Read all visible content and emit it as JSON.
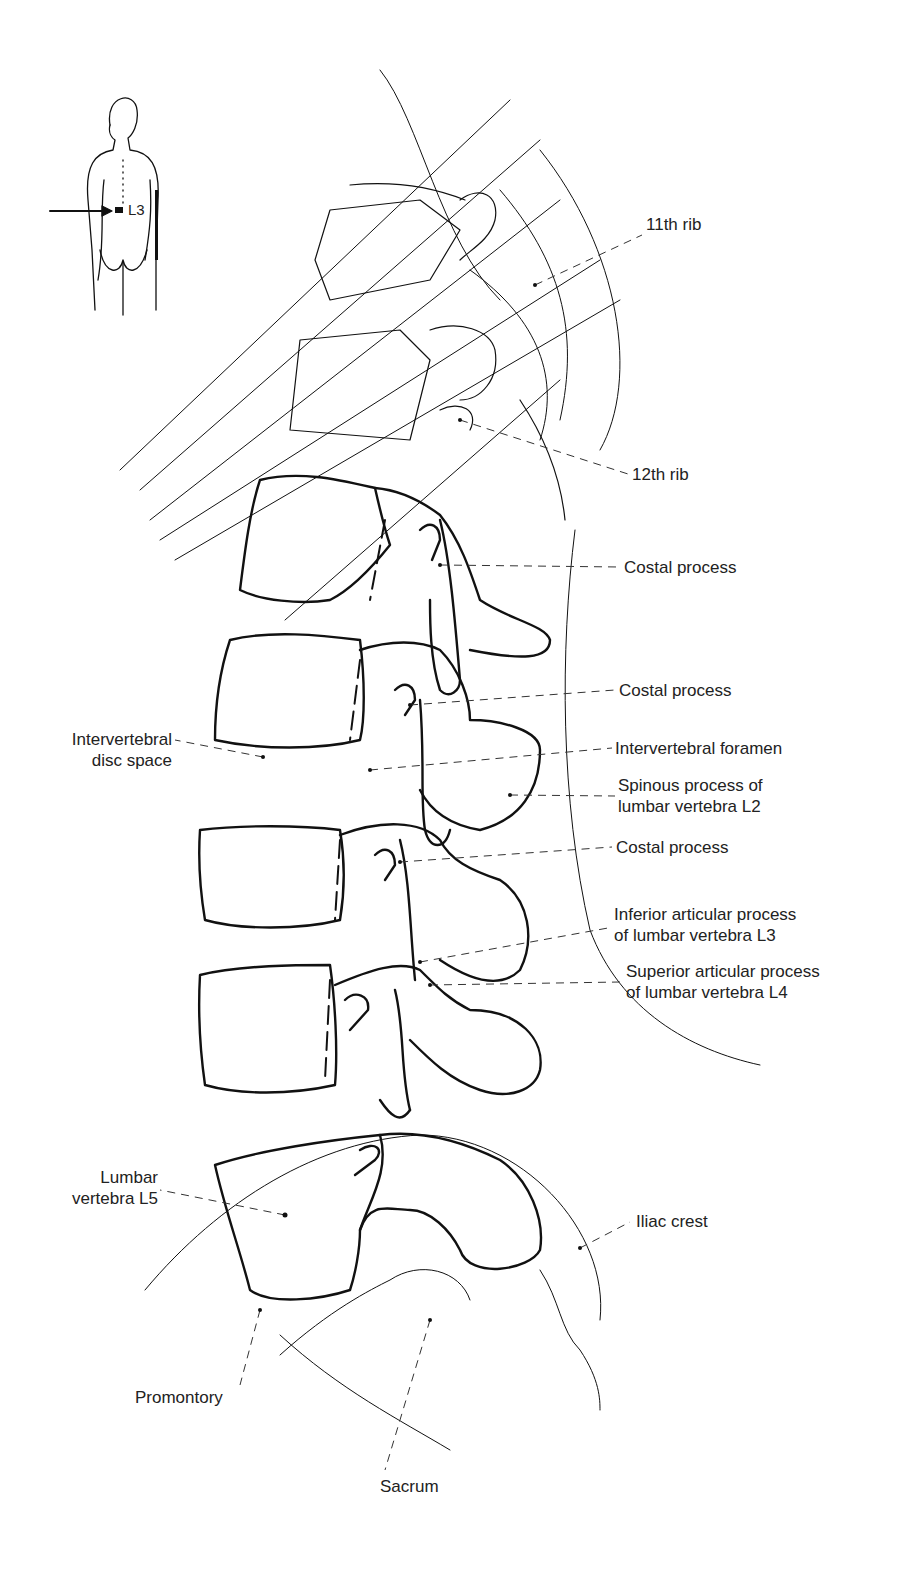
{
  "inset": {
    "level_label": "L3",
    "description": "posterior body view with arrow at L3 level"
  },
  "labels": {
    "rib11": "11th rib",
    "rib12": "12th rib",
    "costal1": "Costal process",
    "costal2": "Costal process",
    "foramen": "Intervertebral foramen",
    "disc_line1": "Intervertebral",
    "disc_line2": "disc space",
    "spinous_line1": "Spinous process of",
    "spinous_line2": "lumbar vertebra L2",
    "costal3": "Costal process",
    "inferior_line1": "Inferior articular process",
    "inferior_line2": "of lumbar vertebra L3",
    "superior_line1": "Superior articular process",
    "superior_line2": "of lumbar vertebra L4",
    "l5_line1": "Lumbar",
    "l5_line2": "vertebra L5",
    "iliac": "Iliac crest",
    "promontory": "Promontory",
    "sacrum": "Sacrum"
  },
  "colors": {
    "line": "#111111",
    "text": "#222222",
    "background": "#ffffff"
  }
}
